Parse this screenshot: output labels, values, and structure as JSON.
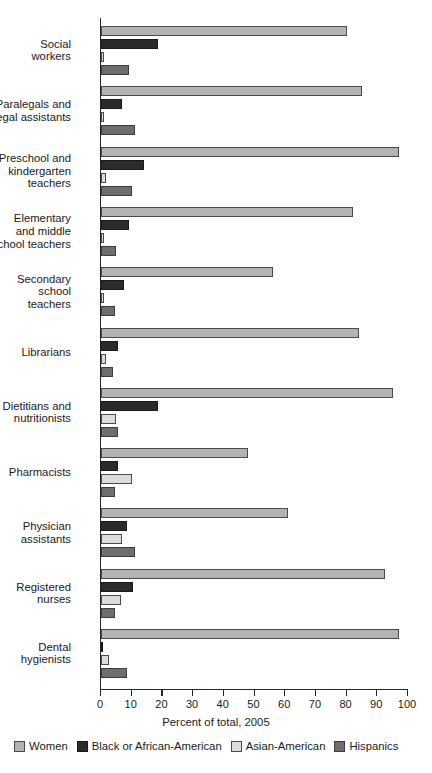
{
  "chart_data": {
    "type": "bar",
    "orientation": "horizontal",
    "title": "",
    "xlabel": "Percent of total, 2005",
    "ylabel": "",
    "xlim": [
      0,
      100
    ],
    "xticks": [
      0,
      10,
      20,
      30,
      40,
      50,
      60,
      70,
      80,
      90,
      100
    ],
    "grid": false,
    "legend_position": "bottom",
    "categories": [
      "Social\nworkers",
      "Paralegals and\nlegal assistants",
      "Preschool and\nkindergarten\nteachers",
      "Elementary\nand middle\nschool teachers",
      "Secondary\nschool\nteachers",
      "Librarians",
      "Dietitians and\nnutritionists",
      "Pharmacists",
      "Physician\nassistants",
      "Registered\nnurses",
      "Dental\nhygienists"
    ],
    "series": [
      {
        "name": "Women",
        "color": "#b3b3b3",
        "values": [
          80.0,
          85.0,
          97.0,
          82.0,
          56.0,
          84.0,
          95.0,
          48.0,
          61.0,
          92.5,
          97.0
        ]
      },
      {
        "name": "Black or African-American",
        "color": "#2b2b2b",
        "values": [
          18.5,
          7.0,
          14.0,
          9.0,
          7.5,
          5.5,
          18.5,
          5.5,
          8.5,
          10.5,
          0.7
        ]
      },
      {
        "name": "Asian-American",
        "color": "#dcdcdc",
        "values": [
          1.0,
          1.0,
          1.5,
          1.0,
          1.0,
          1.5,
          5.0,
          10.0,
          7.0,
          6.5,
          2.5
        ]
      },
      {
        "name": "Hispanics",
        "color": "#6e6e6e",
        "values": [
          9.0,
          11.0,
          10.0,
          5.0,
          4.5,
          4.0,
          5.5,
          4.5,
          11.0,
          4.5,
          8.5
        ]
      }
    ]
  }
}
